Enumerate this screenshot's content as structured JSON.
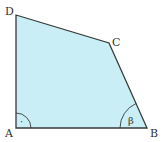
{
  "diagram": {
    "type": "quadrilateral",
    "fill_color": "#c9eef5",
    "stroke_color": "#3a3a3a",
    "vertices": [
      {
        "label": "A",
        "x": 16,
        "y": 128
      },
      {
        "label": "B",
        "x": 147,
        "y": 128
      },
      {
        "label": "C",
        "x": 109,
        "y": 43
      },
      {
        "label": "D",
        "x": 16,
        "y": 15
      }
    ],
    "labels": {
      "A": "A",
      "B": "B",
      "C": "C",
      "D": "D",
      "angle_B": "β",
      "angle_A_marker": "·"
    },
    "angles": [
      {
        "vertex": "A",
        "type": "right-angle",
        "marker": "arc with dot"
      },
      {
        "vertex": "B",
        "type": "labeled",
        "symbol": "β"
      }
    ]
  }
}
